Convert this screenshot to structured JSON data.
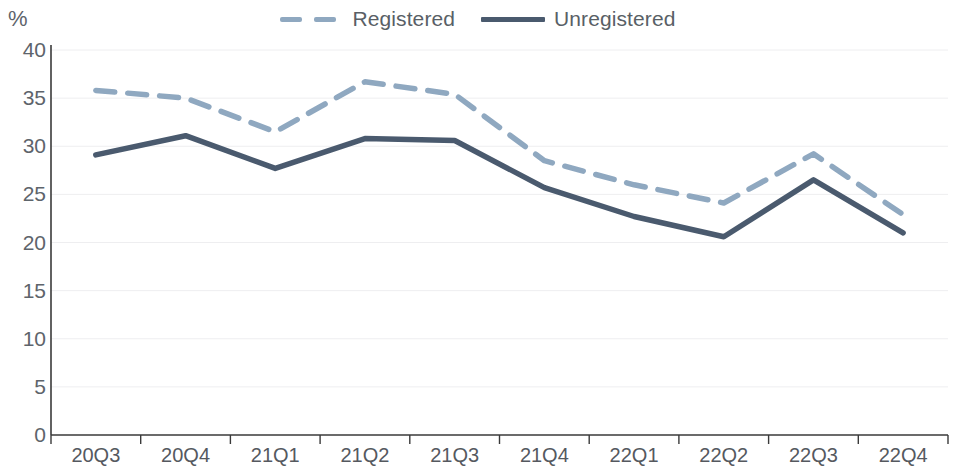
{
  "legend": {
    "position": "top-center",
    "entries": [
      {
        "label": "Registered",
        "color": "#8fa8c0",
        "style": "dashed",
        "swatch_name": "legend-swatch-registered"
      },
      {
        "label": "Unregistered",
        "color": "#4a5a6e",
        "style": "solid",
        "swatch_name": "legend-swatch-unregistered"
      }
    ]
  },
  "axis": {
    "ylabel": "%",
    "yticks": [
      "0",
      "5",
      "10",
      "15",
      "20",
      "25",
      "30",
      "35",
      "40"
    ]
  },
  "colors": {
    "registered": "#8fa8c0",
    "unregistered": "#4a5a6e",
    "gridline": "#eeeef0",
    "axis": "#3a3a3a",
    "text": "#5e646b"
  },
  "chart_data": {
    "type": "line",
    "title": "",
    "subtitle": "",
    "xlabel": "",
    "ylabel": "%",
    "ylim": [
      0,
      40
    ],
    "ytick_step": 5,
    "grid": true,
    "legend_position": "top-center",
    "categories": [
      "20Q3",
      "20Q4",
      "21Q1",
      "21Q2",
      "21Q3",
      "21Q4",
      "22Q1",
      "22Q2",
      "22Q3",
      "22Q4"
    ],
    "series": [
      {
        "name": "Registered",
        "color": "#8fa8c0",
        "style": "dashed",
        "values": [
          35.8,
          35.0,
          31.5,
          36.7,
          35.4,
          28.5,
          26.0,
          24.1,
          29.2,
          22.9
        ]
      },
      {
        "name": "Unregistered",
        "color": "#4a5a6e",
        "style": "solid",
        "values": [
          29.1,
          31.1,
          27.7,
          30.8,
          30.6,
          25.7,
          22.7,
          20.6,
          26.5,
          21.0
        ]
      }
    ]
  }
}
